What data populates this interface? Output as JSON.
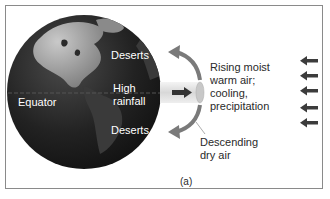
{
  "figure": {
    "panel_label": "(a)",
    "globe": {
      "labels": {
        "deserts_north": "Deserts",
        "high_rainfall_line1": "High",
        "high_rainfall_line2": "rainfall",
        "deserts_south": "Deserts",
        "equator": "Equator"
      }
    },
    "annotations": {
      "rising_air": [
        "Rising moist",
        "warm air;",
        "cooling,",
        "precipitation"
      ],
      "descending_air": [
        "Descending",
        "dry air"
      ]
    },
    "incoming_arrows_count": 5,
    "colors": {
      "globe_ocean": "#1e1e1e",
      "globe_land": "#8c8c8c",
      "arrow_gray": "#7a7a7a",
      "arrow_dark": "#3c3c3c",
      "frame": "#8a8a8a"
    }
  }
}
